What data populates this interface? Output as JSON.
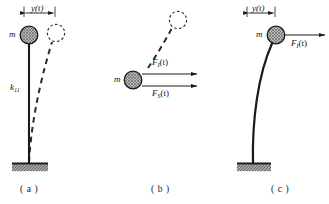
{
  "figure": {
    "background_color": "#ffffff",
    "ink_color": "#1a1a1a",
    "mass_fill_color": "#9a9a9a",
    "ground_fill_color": "#8c8c8c"
  },
  "panels": [
    {
      "id": "a",
      "caption": "( a )",
      "labels": {
        "displacement": "y(t)",
        "mass": "m",
        "stiffness": "k",
        "stiffness_subscript": "11"
      },
      "description": "Undeformed vertical column with lumped mass m at top, fixed base, dashed deformed position displaced by y(t)"
    },
    {
      "id": "b",
      "caption": "( b )",
      "labels": {
        "mass": "m",
        "force_inertia": "F",
        "force_inertia_subscript": "I",
        "force_inertia_arg": "(t)",
        "force_spring": "F",
        "force_spring_subscript": "S",
        "force_spring_arg": "(t)"
      },
      "description": "Free-body diagram of the mass showing inertia force F_I(t) and elastic restoring force F_S(t) acting to the right"
    },
    {
      "id": "c",
      "caption": "( c )",
      "labels": {
        "displacement": "y(t)",
        "mass": "m",
        "force_applied": "F",
        "force_applied_subscript": "I",
        "force_applied_arg": "(t)"
      },
      "description": "Deformed cantilever column with mass m at top displaced by y(t), loaded by force F_I(t)"
    }
  ],
  "geometry": {
    "panel_a": {
      "dimension_line_y": 13,
      "dimension_x_start": 24,
      "dimension_x_end": 55,
      "mass_center": [
        29,
        35
      ],
      "mass_radius": 9,
      "ghost_mass_center": [
        56,
        33
      ],
      "ghost_mass_radius": 9,
      "column_top": [
        29,
        44
      ],
      "column_base": [
        29,
        163
      ],
      "ground_rect": [
        12,
        163,
        36,
        7
      ]
    },
    "panel_b": {
      "mass_center": [
        133,
        80
      ],
      "mass_radius": 9,
      "ghost_mass_center": [
        178,
        20
      ],
      "ghost_mass_radius": 9,
      "arrow_upper": [
        143,
        74,
        199,
        74
      ],
      "arrow_lower": [
        143,
        86,
        199,
        86
      ]
    },
    "panel_c": {
      "dimension_line_y": 13,
      "dimension_x_start": 247,
      "dimension_x_end": 275,
      "mass_center": [
        276,
        35
      ],
      "mass_radius": 9,
      "column_top": [
        272,
        43
      ],
      "column_base": [
        253,
        163
      ],
      "ground_rect": [
        237,
        163,
        34,
        7
      ],
      "arrow": [
        286,
        41,
        324,
        41
      ]
    }
  }
}
